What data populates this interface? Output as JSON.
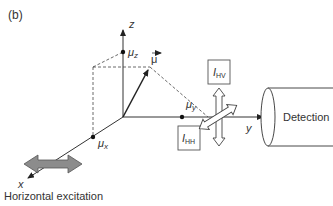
{
  "panel_label": "(b)",
  "axes": {
    "z": "z",
    "y": "y",
    "x": "x"
  },
  "components": {
    "mu_z": "μ",
    "mu_z_sub": "z",
    "mu_y": "μ",
    "mu_y_sub": "y",
    "mu_x": "μ",
    "mu_x_sub": "x",
    "mu_vector": "μ"
  },
  "intensities": {
    "hv": "I",
    "hv_sub": "HV",
    "hh": "I",
    "hh_sub": "HH"
  },
  "detector_label": "Detection",
  "excitation_label": "Horizontal excitation",
  "colors": {
    "line": "#333333",
    "arrow_fill": "#8c8c8c",
    "box_stroke": "#555555"
  }
}
